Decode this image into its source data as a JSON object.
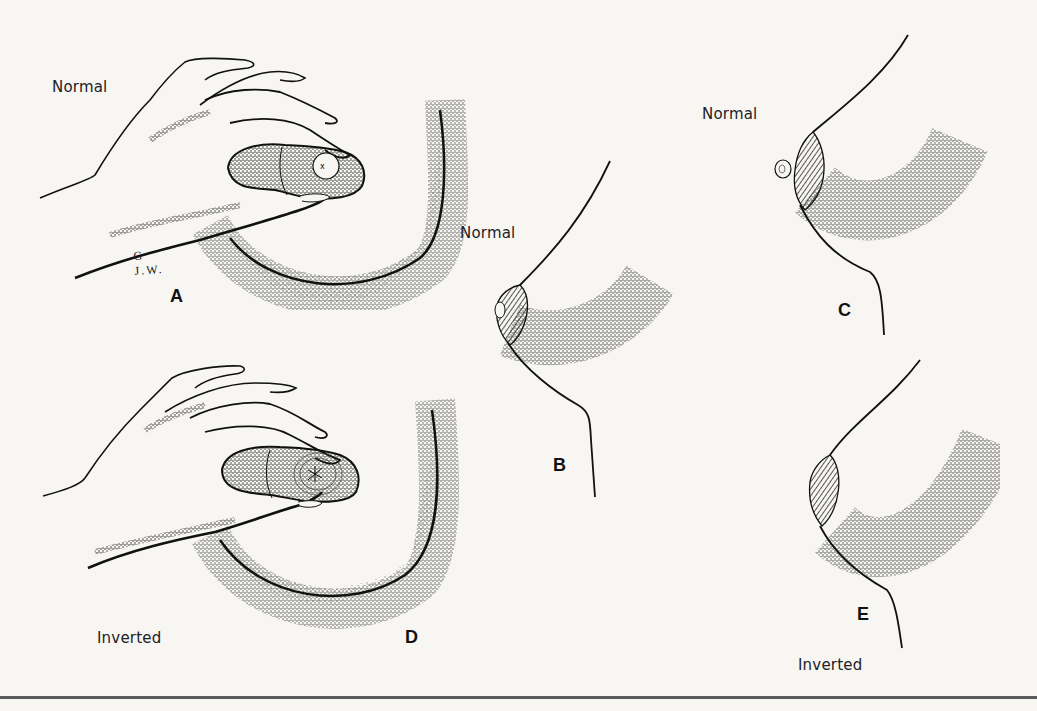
{
  "figure": {
    "background": "#f7f6f3",
    "ink_color": "#1d1d1d",
    "panels": [
      {
        "letter": "A",
        "caption": "Normal",
        "view": "front-view-hand-compression"
      },
      {
        "letter": "B",
        "caption": "Normal",
        "view": "side-profile"
      },
      {
        "letter": "C",
        "caption": "Normal",
        "view": "side-profile-compressed"
      },
      {
        "letter": "D",
        "caption": "Inverted",
        "view": "front-view-hand-compression"
      },
      {
        "letter": "E",
        "caption": "Inverted",
        "view": "side-profile-compressed"
      }
    ],
    "signature": "G J.W."
  }
}
